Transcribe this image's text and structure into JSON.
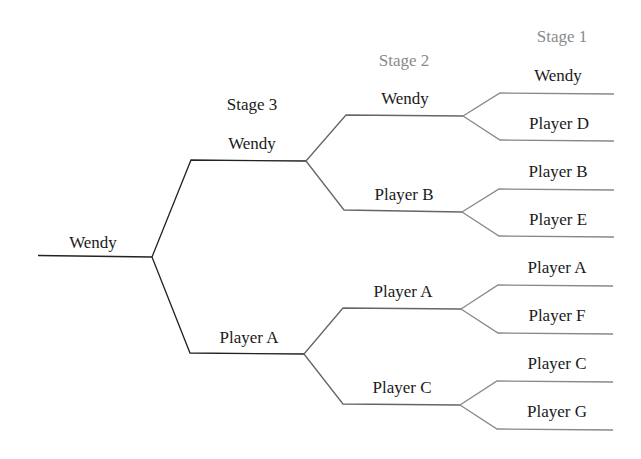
{
  "diagram": {
    "type": "tournament-bracket",
    "colors": {
      "stage3_line": "#222222",
      "stage2_line": "#666666",
      "stage1_line": "#888888",
      "stage3_label": "#1a1a1a",
      "stage2_label": "#8a8a8a",
      "stage1_label": "#8a8a8a",
      "text": "#1a1a1a"
    },
    "stages": {
      "stage3": "Stage 3",
      "stage2": "Stage 2",
      "stage1": "Stage 1"
    },
    "champion": "Wendy",
    "stage3": {
      "top": "Wendy",
      "bottom": "Player A"
    },
    "stage2": {
      "m1": "Wendy",
      "m2": "Player B",
      "m3": "Player A",
      "m4": "Player C"
    },
    "stage1": {
      "s1": "Wendy",
      "s2": "Player D",
      "s3": "Player B",
      "s4": "Player E",
      "s5": "Player A",
      "s6": "Player F",
      "s7": "Player C",
      "s8": "Player G"
    }
  }
}
